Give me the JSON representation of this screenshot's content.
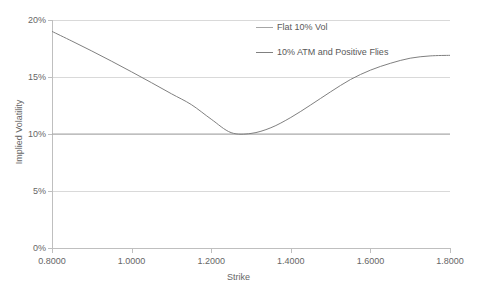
{
  "chart_data": {
    "type": "line",
    "title": "",
    "xlabel": "Strike",
    "ylabel": "Implied Volatility",
    "xlim": [
      0.8,
      1.8
    ],
    "ylim": [
      0,
      0.2
    ],
    "grid": true,
    "legend_position": "inside-top-center",
    "x_tick_labels": [
      "0.8000",
      "1.0000",
      "1.2000",
      "1.4000",
      "1.6000",
      "1.8000"
    ],
    "x_ticks": [
      0.8,
      1.0,
      1.2,
      1.4,
      1.6,
      1.8
    ],
    "y_tick_labels": [
      "0%",
      "5%",
      "10%",
      "15%",
      "20%"
    ],
    "y_ticks": [
      0,
      0.05,
      0.1,
      0.15,
      0.2
    ],
    "series": [
      {
        "name": "Flat 10% Vol",
        "color": "#a6a6a6",
        "x": [
          0.8,
          1.8
        ],
        "values": [
          0.1,
          0.1
        ]
      },
      {
        "name": "10% ATM and Positive Flies",
        "color": "#808080",
        "x": [
          0.8,
          0.85,
          0.9,
          0.95,
          1.0,
          1.05,
          1.1,
          1.15,
          1.2,
          1.25,
          1.3,
          1.35,
          1.4,
          1.45,
          1.5,
          1.55,
          1.6,
          1.65,
          1.7,
          1.75,
          1.8
        ],
        "values": [
          0.19,
          0.1815,
          0.1728,
          0.1638,
          0.1545,
          0.145,
          0.1353,
          0.1258,
          0.113,
          0.1012,
          0.1005,
          0.1055,
          0.1145,
          0.1255,
          0.137,
          0.1478,
          0.156,
          0.162,
          0.1665,
          0.1685,
          0.169
        ]
      }
    ]
  },
  "legend": {
    "entries": [
      {
        "label": "Flat 10% Vol",
        "color": "#a6a6a6"
      },
      {
        "label": "10% ATM and Positive Flies",
        "color": "#808080"
      }
    ]
  },
  "axes": {
    "x_title": "Strike",
    "y_title": "Implied Volatility"
  },
  "colors": {
    "gridline": "#d9d9d9",
    "axis": "#bfbfbf",
    "text": "#666666",
    "background": "#ffffff"
  }
}
